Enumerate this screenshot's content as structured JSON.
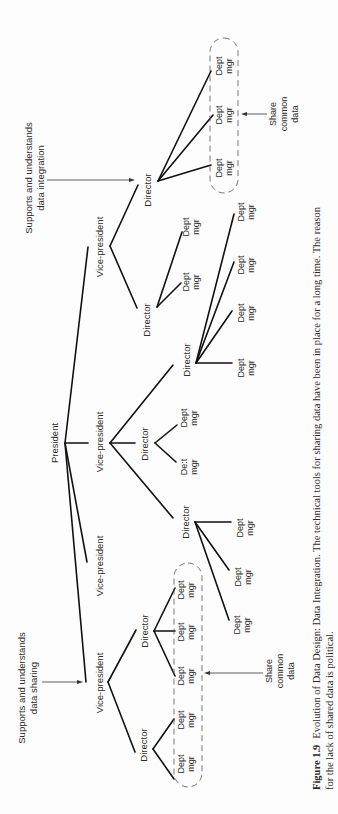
{
  "figure": {
    "caption": {
      "number": "Figure 1.9",
      "line1": "Evolution of Data Design: Data Integration.  The technical tools for sharing data have been in place for a long time.  The reason",
      "line2": "for the lack of shared data is political."
    },
    "annotations": {
      "top_note_line1": "Supports and understands",
      "top_note_line2": "data integration",
      "bottom_note_line1": "Supports and understands",
      "bottom_note_line2": "data sharing",
      "share_line1": "Share",
      "share_line2": "common",
      "share_line3": "data"
    },
    "labels": {
      "president": "President",
      "vice_president": "Vice-president",
      "director": "Director",
      "dept_line1": "Dept",
      "dept_line2": "mgr",
      "dept_line1_smudged": "De:t"
    },
    "hierarchy": {
      "node": "President",
      "children": [
        {
          "node": "Vice-president",
          "supports": "data integration",
          "children": [
            {
              "node": "Director",
              "shares_common_data": true,
              "children": [
                "Dept mgr",
                "Dept mgr",
                "Dept mgr"
              ]
            },
            {
              "node": "Director",
              "children": [
                "Dept mgr",
                "Dept mgr"
              ]
            }
          ]
        },
        {
          "node": "Vice-president",
          "children": [
            {
              "node": "Director",
              "children": [
                "Dept mgr",
                "Dept mgr",
                "Dept mgr",
                "Dept mgr"
              ]
            },
            {
              "node": "Director",
              "children": [
                "Dept mgr",
                "Dept mgr"
              ]
            },
            {
              "node": "Director",
              "children": [
                "Dept mgr",
                "Dept mgr",
                "Dept mgr"
              ]
            }
          ]
        },
        {
          "node": "Vice-president",
          "children": []
        },
        {
          "node": "Vice-president",
          "supports": "data sharing",
          "children": [
            {
              "node": "Director",
              "shares_common_data": true,
              "children": [
                "Dept mgr",
                "Dept mgr",
                "Dept mgr"
              ]
            },
            {
              "node": "Director",
              "shares_common_data": true,
              "children": [
                "Dept mgr",
                "Dept mgr"
              ]
            }
          ]
        }
      ]
    }
  }
}
